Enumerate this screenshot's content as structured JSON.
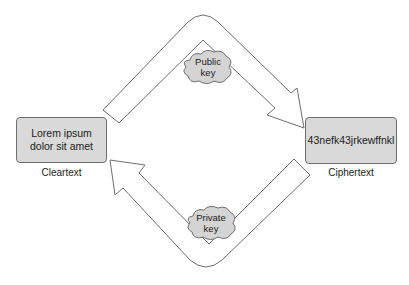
{
  "diagram": {
    "cleartext_box": {
      "text": "Lorem ipsum dolor sit amet",
      "label": "Cleartext"
    },
    "ciphertext_box": {
      "text": "43nefk43jrkewffnkl",
      "label": "Ciphertext"
    },
    "public_key": {
      "line1": "Public",
      "line2": "key"
    },
    "private_key": {
      "line1": "Private",
      "line2": "key"
    },
    "colors": {
      "box_fill": "#d9d9d9",
      "stroke": "#6e6e6e",
      "arrow_fill": "#ffffff"
    }
  }
}
